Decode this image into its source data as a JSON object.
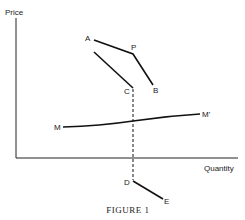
{
  "figure": {
    "caption": "Figure 1",
    "caption_display": "FIGURE 1",
    "axes": {
      "y_label": "Price",
      "x_label": "Quantity"
    },
    "points": {
      "A": "A",
      "P": "P",
      "B": "B",
      "C": "C",
      "M": "M",
      "M_prime": "M'",
      "D": "D",
      "E": "E"
    },
    "curves": [
      {
        "name": "AP",
        "from": "A",
        "to": "P",
        "style": "solid"
      },
      {
        "name": "PB",
        "from": "P",
        "to": "B",
        "style": "solid"
      },
      {
        "name": "line-to-C",
        "to": "C",
        "style": "solid"
      },
      {
        "name": "MM'",
        "from": "M",
        "to": "M'",
        "style": "solid"
      },
      {
        "name": "PD-dashed",
        "from": "C",
        "to": "D",
        "style": "dashed"
      },
      {
        "name": "DE",
        "from": "D",
        "to": "E",
        "style": "solid"
      }
    ]
  }
}
